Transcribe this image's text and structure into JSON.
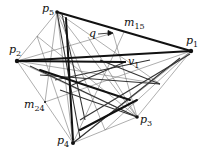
{
  "diagram": {
    "type": "geometric-graph",
    "points": {
      "p1": {
        "x": 191,
        "y": 51,
        "label": "p",
        "sub": "1"
      },
      "p2": {
        "x": 17,
        "y": 61,
        "label": "p",
        "sub": "2"
      },
      "p3": {
        "x": 137,
        "y": 117,
        "label": "p",
        "sub": "3"
      },
      "p4": {
        "x": 73,
        "y": 143,
        "label": "p",
        "sub": "4"
      },
      "p5": {
        "x": 57,
        "y": 12,
        "label": "p",
        "sub": "5"
      }
    },
    "annotations": {
      "m15": {
        "label": "m",
        "sub": "15"
      },
      "m24": {
        "label": "m",
        "sub": "24"
      },
      "v1": {
        "label": "v",
        "sub": "1"
      },
      "q": {
        "label": "q"
      }
    }
  }
}
